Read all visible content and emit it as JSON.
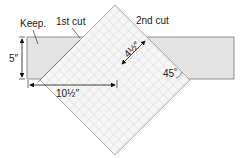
{
  "labels": {
    "keep": "Keep.",
    "first_cut": "1st cut",
    "second_cut": "2nd cut",
    "height": "5″",
    "width": "10½″",
    "diagonal": "4½″",
    "angle": "45˚"
  },
  "colors": {
    "strip_fill": "#e3e3e3",
    "strip_stroke": "#777777",
    "grid_fill": "#f6f6f6",
    "grid_line": "#bdbdbd",
    "arrow": "#111111"
  }
}
